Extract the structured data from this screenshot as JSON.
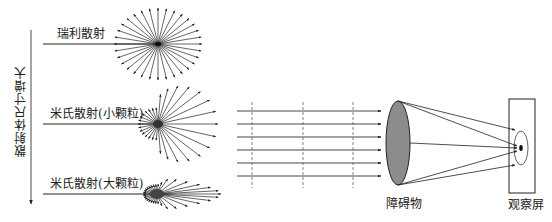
{
  "diagram": {
    "axis_label": "散射体尺寸增大",
    "scattering_types": [
      {
        "label": "瑞利散射",
        "kind": "rayleigh",
        "cx": 158,
        "cy": 44
      },
      {
        "label": "米氏散射(小颗粒)",
        "kind": "mie-small",
        "cx": 158,
        "cy": 124
      },
      {
        "label": "米氏散射(大颗粒)",
        "kind": "mie-large",
        "cx": 157,
        "cy": 194
      }
    ],
    "beam": {
      "ray_count": 6,
      "wavefront_count": 3
    },
    "obstacle_label": "障碍物",
    "screen_label": "观察屏",
    "colors": {
      "line": "#222222",
      "obstacle_fill": "#8c8c8c",
      "dash": "#666666"
    }
  }
}
